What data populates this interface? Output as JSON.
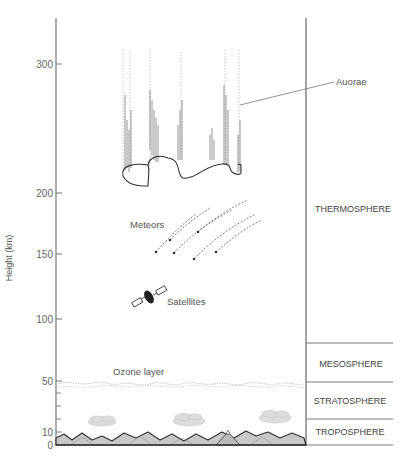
{
  "diagram": {
    "title": "",
    "y_axis": {
      "label": "Height (km)",
      "ticks": [
        {
          "value": 0,
          "label": "0",
          "y": 444
        },
        {
          "value": 10,
          "label": "10",
          "y": 432
        },
        {
          "value": 50,
          "label": "50",
          "y": 381
        },
        {
          "value": 100,
          "label": "100",
          "y": 319
        },
        {
          "value": 150,
          "label": "150",
          "y": 254
        },
        {
          "value": 200,
          "label": "200",
          "y": 193
        },
        {
          "value": 300,
          "label": "300",
          "y": 64
        }
      ]
    },
    "layers": [
      {
        "name": "THERMOSPHERE",
        "label": "THERMOSPHERE"
      },
      {
        "name": "MESOSPHERE",
        "label": "MESOSPHERE"
      },
      {
        "name": "STRATOSPHERE",
        "label": "STRATOSPHERE"
      },
      {
        "name": "TROPOSPHERE",
        "label": "TROPOSPHERE"
      }
    ],
    "annotations": {
      "aurorae": "Auorae",
      "meteors": "Meteors",
      "satellites": "Satellites",
      "ozone": "Ozone layer"
    },
    "colors": {
      "axis": "#777777",
      "line": "#555555",
      "mountain_fill": "#c8c8c8",
      "cloud_fill": "#dddddd",
      "ozone": "#bbbbbb"
    }
  }
}
